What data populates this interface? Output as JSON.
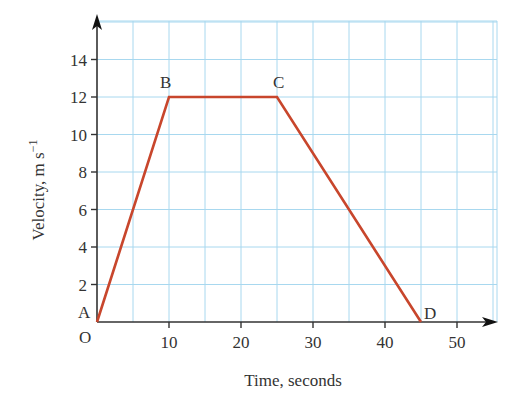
{
  "chart_data": {
    "type": "line",
    "title": "",
    "xlabel": "Time, seconds",
    "ylabel": "Velocity, m s",
    "ylabel_superscript": "−1",
    "xlim": [
      0,
      55
    ],
    "ylim": [
      0,
      16
    ],
    "x_ticks": [
      10,
      20,
      30,
      40,
      50
    ],
    "y_ticks": [
      2,
      4,
      6,
      8,
      10,
      12,
      14
    ],
    "origin_label": "O",
    "grid": true,
    "grid_minor_x": 5,
    "grid_minor_y": 2,
    "series": [
      {
        "name": "velocity",
        "color": "#c8462c",
        "points": [
          {
            "label": "A",
            "x": 0,
            "y": 0
          },
          {
            "label": "B",
            "x": 10,
            "y": 12
          },
          {
            "label": "C",
            "x": 25,
            "y": 12
          },
          {
            "label": "D",
            "x": 45,
            "y": 0
          }
        ]
      }
    ],
    "colors": {
      "grid": "#a8d8ef",
      "axis": "#333333",
      "line": "#c8462c"
    }
  }
}
